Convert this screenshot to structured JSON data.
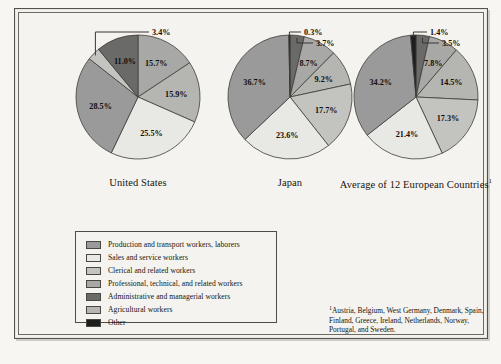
{
  "figure": {
    "legend": {
      "items": [
        {
          "label": "Production and transport workers, laborers",
          "color": "#9a9a9a"
        },
        {
          "label": "Sales and service workers",
          "color": "#e8e8e4"
        },
        {
          "label": "Clerical and related workers",
          "color": "#c3c3c0"
        },
        {
          "label": "Professional, technical, and related workers",
          "color": "#a8a8a6"
        },
        {
          "label": "Administrative and managerial workers",
          "color": "#6a6a68"
        },
        {
          "label": "Agricultural workers",
          "color": "#b5b5b2"
        },
        {
          "label": "Other",
          "color": "#1d1d1b"
        }
      ]
    },
    "footnote": {
      "marker": "1",
      "text": "Austria, Belgium, West Germany, Denmark, Spain, Finland, Greece, Ireland, Netherlands, Norway, Portugal, and Sweden."
    },
    "below_caption": "Table 1 continued caption text"
  },
  "chart_data": [
    {
      "type": "pie",
      "title": "United States",
      "title_footnote": "",
      "categories": [
        "Professional, technical, and related workers",
        "Clerical and related workers",
        "Sales and service workers",
        "Production and transport workers, laborers",
        "Agricultural workers",
        "Administrative and managerial workers"
      ],
      "values": [
        15.7,
        15.9,
        25.5,
        28.5,
        3.4,
        11.0
      ],
      "labels": [
        "15.7%",
        "15.9%",
        "25.5%",
        "28.5%",
        "3.4%",
        "11.0%"
      ],
      "colors": [
        "#a8a8a6",
        "#b5b5b2",
        "#e8e8e4",
        "#9a9a9a",
        "#c3c3c0",
        "#6a6a68"
      ],
      "callouts": [
        "3.4%"
      ]
    },
    {
      "type": "pie",
      "title": "Japan",
      "title_footnote": "",
      "categories": [
        "Administrative and managerial workers",
        "Professional, technical, and related workers",
        "Clerical and related workers",
        "Sales and service workers",
        "Production and transport workers, laborers",
        "Agricultural workers",
        "Other"
      ],
      "values": [
        3.7,
        8.7,
        9.2,
        17.7,
        23.6,
        36.7,
        0.3
      ],
      "labels": [
        "3.7%",
        "8.7%",
        "9.2%",
        "17.7%",
        "23.6%",
        "36.7%",
        "0.3%"
      ],
      "colors": [
        "#6a6a68",
        "#a8a8a6",
        "#b5b5b2",
        "#c3c3c0",
        "#e8e8e4",
        "#9a9a9a",
        "#1d1d1b"
      ],
      "callouts": [
        "0.3%",
        "3.7%"
      ]
    },
    {
      "type": "pie",
      "title": "Average of 12 European Countries",
      "title_footnote": "1",
      "categories": [
        "Administrative and managerial workers",
        "Professional, technical, and related workers",
        "Clerical and related workers",
        "Sales and service workers",
        "Production and transport workers, laborers",
        "Agricultural workers",
        "Other"
      ],
      "values": [
        3.5,
        7.8,
        14.5,
        17.3,
        21.4,
        34.2,
        1.4
      ],
      "labels": [
        "3.5%",
        "7.8%",
        "14.5%",
        "17.3%",
        "21.4%",
        "34.2%",
        "1.4%"
      ],
      "colors": [
        "#6a6a68",
        "#a8a8a6",
        "#b5b5b2",
        "#c3c3c0",
        "#e8e8e4",
        "#9a9a9a",
        "#1d1d1b"
      ],
      "callouts": [
        "1.4%",
        "3.5%"
      ]
    }
  ]
}
